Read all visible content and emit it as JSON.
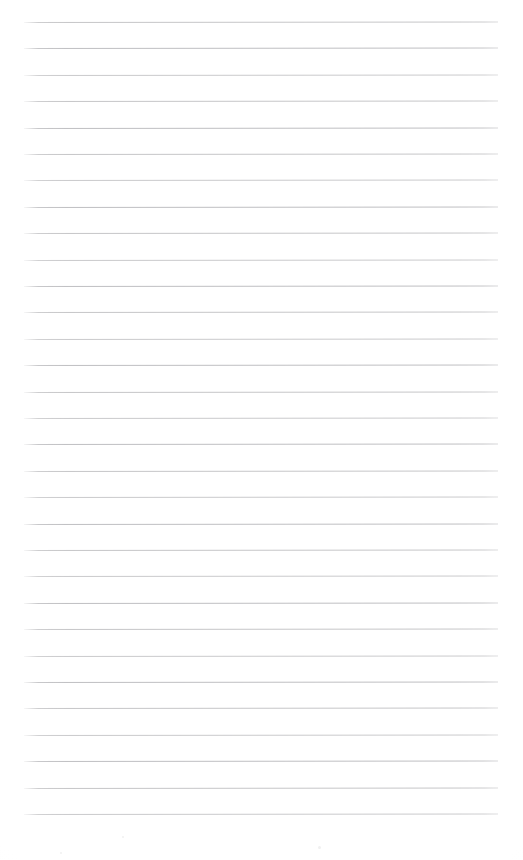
{
  "document": {
    "kind": "ruled-notebook-page",
    "title": "Blank lined page",
    "page_width": 523,
    "page_height": 860,
    "background_color": "#ffffff",
    "has_text": false,
    "text_content": "",
    "handwriting_present": false,
    "header_text": "",
    "footer_text": "",
    "page_number": "",
    "margin_rule": {
      "present": false
    }
  },
  "ruling": {
    "style": "wide-ruled horizontal lines",
    "line_color": "#c2c2c4",
    "line_thickness_px": 1,
    "line_count": 31,
    "first_line_y": 22,
    "line_spacing_px": 26.4,
    "left_x": 24,
    "right_x": 498,
    "line_length_px": 474,
    "skew_degrees": -0.055,
    "bottom_blank_margin_px": 43,
    "top_blank_margin_px": 22,
    "lines": [
      {
        "index": 1,
        "y": 22,
        "tone": "mottle-a"
      },
      {
        "index": 2,
        "y": 48,
        "tone": "mottle-b"
      },
      {
        "index": 3,
        "y": 75,
        "tone": "mottle-c"
      },
      {
        "index": 4,
        "y": 101,
        "tone": "mottle-a"
      },
      {
        "index": 5,
        "y": 128,
        "tone": "mottle-b"
      },
      {
        "index": 6,
        "y": 154,
        "tone": "mottle-a"
      },
      {
        "index": 7,
        "y": 180,
        "tone": "mottle-c"
      },
      {
        "index": 8,
        "y": 207,
        "tone": "mottle-b"
      },
      {
        "index": 9,
        "y": 233,
        "tone": "mottle-a"
      },
      {
        "index": 10,
        "y": 260,
        "tone": "mottle-c"
      },
      {
        "index": 11,
        "y": 286,
        "tone": "mottle-b"
      },
      {
        "index": 12,
        "y": 312,
        "tone": "mottle-a"
      },
      {
        "index": 13,
        "y": 339,
        "tone": "mottle-c"
      },
      {
        "index": 14,
        "y": 365,
        "tone": "mottle-b"
      },
      {
        "index": 15,
        "y": 392,
        "tone": "mottle-a"
      },
      {
        "index": 16,
        "y": 418,
        "tone": "mottle-c"
      },
      {
        "index": 17,
        "y": 444,
        "tone": "mottle-b"
      },
      {
        "index": 18,
        "y": 471,
        "tone": "mottle-a"
      },
      {
        "index": 19,
        "y": 497,
        "tone": "mottle-c"
      },
      {
        "index": 20,
        "y": 524,
        "tone": "mottle-b"
      },
      {
        "index": 21,
        "y": 550,
        "tone": "mottle-a"
      },
      {
        "index": 22,
        "y": 576,
        "tone": "mottle-c"
      },
      {
        "index": 23,
        "y": 603,
        "tone": "mottle-b"
      },
      {
        "index": 24,
        "y": 629,
        "tone": "mottle-a"
      },
      {
        "index": 25,
        "y": 656,
        "tone": "mottle-c"
      },
      {
        "index": 26,
        "y": 682,
        "tone": "mottle-b"
      },
      {
        "index": 27,
        "y": 708,
        "tone": "mottle-a"
      },
      {
        "index": 28,
        "y": 735,
        "tone": "mottle-c"
      },
      {
        "index": 29,
        "y": 761,
        "tone": "mottle-b"
      },
      {
        "index": 30,
        "y": 788,
        "tone": "mottle-a"
      },
      {
        "index": 31,
        "y": 814,
        "tone": "mottle-c"
      }
    ]
  },
  "specks": [
    {
      "x": 318,
      "y": 846,
      "size": 3
    },
    {
      "x": 60,
      "y": 852,
      "size": 2
    },
    {
      "x": 122,
      "y": 836,
      "size": 2
    }
  ]
}
